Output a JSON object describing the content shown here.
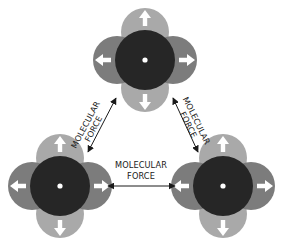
{
  "diagram": {
    "title": "",
    "colors": {
      "background": "#ffffff",
      "lobe_vertical": "#a9a9a9",
      "lobe_horizontal": "#7c7c7c",
      "core": "#262626",
      "nucleus": "#ffffff",
      "arrow_glyph": "#ffffff",
      "force_line": "#1a1a1a"
    },
    "molecules": [
      {
        "id": "top",
        "cx": 145,
        "cy": 60
      },
      {
        "id": "bottom-left",
        "cx": 60,
        "cy": 186
      },
      {
        "id": "bottom-right",
        "cx": 223,
        "cy": 186
      }
    ],
    "forces": [
      {
        "id": "left",
        "between": [
          "top",
          "bottom-left"
        ],
        "line1": "MOLECULAR",
        "line2": "FORCE"
      },
      {
        "id": "right",
        "between": [
          "top",
          "bottom-right"
        ],
        "line1": "MOLECULAR",
        "line2": "FORCE"
      },
      {
        "id": "bottom",
        "between": [
          "bottom-left",
          "bottom-right"
        ],
        "line1": "MOLECULAR",
        "line2": "FORCE"
      }
    ]
  }
}
